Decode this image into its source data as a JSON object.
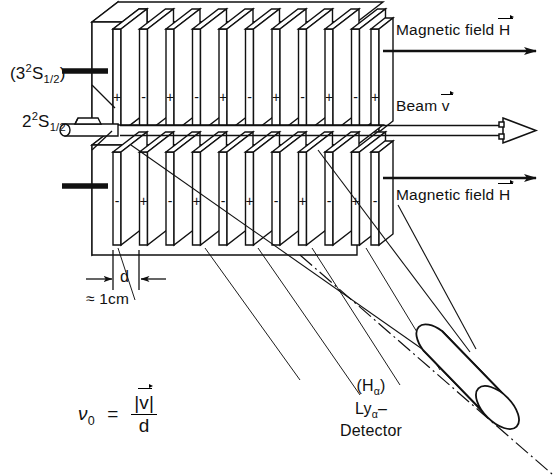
{
  "figure": {
    "kind": "apparatus-diagram",
    "title_absent": true,
    "stroke_color": "#111111",
    "background_color": "#ffffff"
  },
  "labels": {
    "state_upper_prefix": "(3",
    "state_upper_sup": "2",
    "state_upper_core": "S",
    "state_upper_sub": "1/2",
    "state_upper_suffix": ")",
    "state_upper_plain": "(3²S₁₂)",
    "state_lower_prefix": "2",
    "state_lower_sup": "2",
    "state_lower_core": "S",
    "state_lower_sub": "1/2",
    "state_lower_plain": "2²S₁₂",
    "magnetic_field_top": "Magnetic field",
    "magnetic_field_top_vector": "H",
    "magnetic_field_bottom": "Magnetic field",
    "magnetic_field_bottom_vector": "H",
    "beam": "Beam",
    "beam_vector": "v",
    "plate_gap_symbol": "d",
    "plate_gap_value": "≈ 1cm",
    "detector_line1": "(H",
    "detector_line1_sub": "α",
    "detector_line1_close": ")",
    "detector_line2_core": "Ly",
    "detector_line2_sub": "α",
    "detector_line2_dash": "–",
    "detector_line3": "Detector"
  },
  "formula": {
    "symbol": "ν",
    "symbol_sub": "0",
    "equals": "=",
    "numerator": "|v|",
    "numerator_vector": "v",
    "numerator_bar_left": "|",
    "numerator_bar_right": "|",
    "denominator": "d"
  },
  "plates": {
    "count_per_row": 11,
    "upper_row_signs": [
      "+",
      "-",
      "+",
      "-",
      "+",
      "-",
      "+",
      "-",
      "+",
      "-",
      "+"
    ],
    "lower_row_signs": [
      "-",
      "+",
      "-",
      "+",
      "-",
      "+",
      "-",
      "+",
      "-",
      "+",
      "-"
    ],
    "pitch_px": 26.5,
    "first_plate_x": 113,
    "upper_row_sign_y": 97,
    "lower_row_sign_y": 201
  },
  "geometry": {
    "canvas_width": 554,
    "canvas_height": 476,
    "upper_block": {
      "x": 92,
      "y": 22,
      "w": 290,
      "h": 110
    },
    "lower_block": {
      "x": 92,
      "y": 152,
      "w": 290,
      "h": 98
    },
    "detector_cylinder": {
      "cx": 470,
      "cy": 385,
      "length": 120,
      "radius": 28,
      "angle_deg": 40
    }
  }
}
